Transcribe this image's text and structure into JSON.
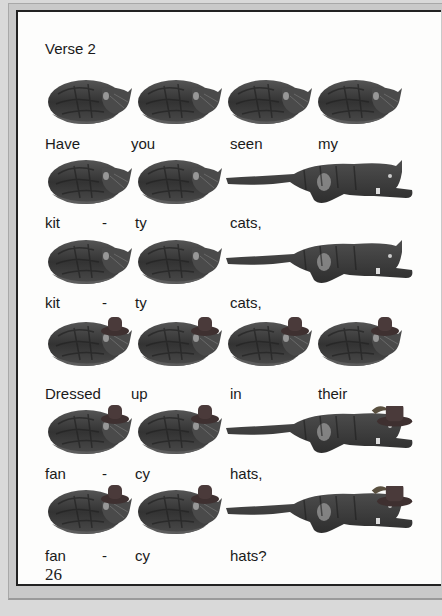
{
  "page": {
    "verse_title": "Verse 2",
    "page_number": "26"
  },
  "rows": [
    {
      "cats": [
        "curled",
        "curled",
        "curled",
        "curled"
      ],
      "hat": false,
      "words": [
        "Have",
        "you",
        "seen",
        "my"
      ]
    },
    {
      "cats": [
        "curled",
        "curled",
        "stretched"
      ],
      "hat": false,
      "words": [
        "kit",
        "-",
        "ty",
        "cats,"
      ]
    },
    {
      "cats": [
        "curled",
        "curled",
        "stretched"
      ],
      "hat": false,
      "words": [
        "kit",
        "-",
        "ty",
        "cats,"
      ]
    },
    {
      "cats": [
        "curled",
        "curled",
        "curled",
        "curled"
      ],
      "hat": true,
      "words": [
        "Dressed",
        "up",
        "in",
        "their"
      ]
    },
    {
      "cats": [
        "curled",
        "curled",
        "stretched"
      ],
      "hat": true,
      "words": [
        "fan",
        "-",
        "cy",
        "hats,"
      ]
    },
    {
      "cats": [
        "curled",
        "curled",
        "stretched"
      ],
      "hat": true,
      "words": [
        "fan",
        "-",
        "cy",
        "hats?"
      ]
    }
  ],
  "colors": {
    "frame_gray": "#c9c9c9",
    "page_white": "#fdfdfc",
    "border_dark": "#222222",
    "cat_dark": "#3a3a3a",
    "hat": "#4a3a3a"
  }
}
